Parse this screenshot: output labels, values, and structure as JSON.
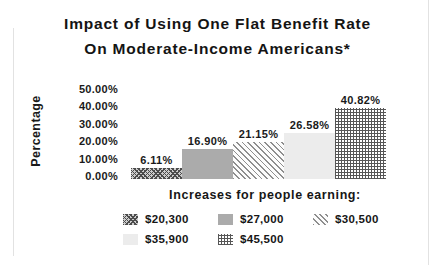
{
  "title": {
    "line1": "Impact of Using One Flat Benefit Rate",
    "line2": "On Moderate-Income Americans*"
  },
  "y_axis": {
    "label": "Percentage",
    "ticks": [
      "50.00%",
      "40.00%",
      "30.00%",
      "20.00%",
      "10.00%",
      "0.00%"
    ]
  },
  "x_axis": {
    "title": "Increases for people earning:"
  },
  "chart_data": {
    "type": "bar",
    "title": "Impact of Using One Flat Benefit Rate On Moderate-Income Americans*",
    "categories": [
      "$20,300",
      "$27,000",
      "$30,500",
      "$35,900",
      "$45,500"
    ],
    "values": [
      6.11,
      16.9,
      21.15,
      26.58,
      40.82
    ],
    "bar_labels": [
      "6.11%",
      "16.90%",
      "21.15%",
      "26.58%",
      "40.82%"
    ],
    "xlabel": "Increases for people earning:",
    "ylabel": "Percentage",
    "ylim": [
      0,
      50
    ],
    "y_tick_step": 10,
    "grid": false,
    "legend_position": "bottom",
    "legend_entries": [
      "$20,300",
      "$27,000",
      "$30,500",
      "$35,900",
      "$45,500"
    ],
    "patterns": [
      "diagonal-crosshatch",
      "solid-gray",
      "diagonal-stripes",
      "light-solid",
      "grid-crosshatch"
    ],
    "colors": {
      "solid_gray": "#ababab",
      "light_gray": "#ececec",
      "hatch_dark": "#4c4c4c",
      "text": "#141414",
      "background": "#ffffff"
    }
  }
}
